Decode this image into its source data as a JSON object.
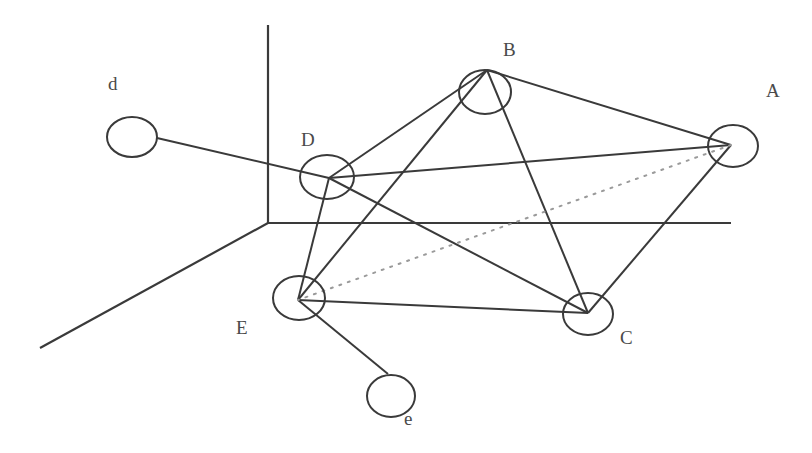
{
  "figure": {
    "type": "graph-diagram",
    "colors": {
      "background": "#ffffff",
      "stroke": "#3a3a3a",
      "dotted_edge": "#9a9a9a",
      "label": "#4a4a4a"
    }
  },
  "axes": [
    {
      "id": "vertical-axis",
      "x1": 268,
      "y1": 25,
      "x2": 268,
      "y2": 223
    },
    {
      "id": "horizontal-axis",
      "x1": 268,
      "y1": 223,
      "x2": 731,
      "y2": 223
    },
    {
      "id": "depth-axis",
      "x1": 268,
      "y1": 223,
      "x2": 40,
      "y2": 348
    }
  ],
  "nodes": [
    {
      "id": "A",
      "label": "A",
      "cx": 733,
      "cy": 146,
      "rx": 25,
      "ry": 21,
      "vx": 731,
      "vy": 145,
      "lx": 766,
      "ly": 97
    },
    {
      "id": "B",
      "label": "B",
      "cx": 485,
      "cy": 92,
      "rx": 26,
      "ry": 22,
      "vx": 487,
      "vy": 70,
      "lx": 503,
      "ly": 56
    },
    {
      "id": "C",
      "label": "C",
      "cx": 588,
      "cy": 314,
      "rx": 25,
      "ry": 21,
      "vx": 588,
      "vy": 313,
      "lx": 620,
      "ly": 344
    },
    {
      "id": "D",
      "label": "D",
      "cx": 327,
      "cy": 177,
      "rx": 27,
      "ry": 22,
      "vx": 329,
      "vy": 178,
      "lx": 301,
      "ly": 146
    },
    {
      "id": "E",
      "label": "E",
      "cx": 299,
      "cy": 298,
      "rx": 26,
      "ry": 22,
      "vx": 298,
      "vy": 300,
      "lx": 236,
      "ly": 334
    },
    {
      "id": "d",
      "label": "d",
      "cx": 132,
      "cy": 137,
      "rx": 25,
      "ry": 20,
      "vx": 157,
      "vy": 138,
      "lx": 108,
      "ly": 90
    },
    {
      "id": "e",
      "label": "e",
      "cx": 391,
      "cy": 396,
      "rx": 24,
      "ry": 21,
      "vx": 388,
      "vy": 374,
      "lx": 404,
      "ly": 425
    }
  ],
  "edges": [
    {
      "from": "d",
      "to": "D",
      "style": "solid"
    },
    {
      "from": "D",
      "to": "B",
      "style": "solid"
    },
    {
      "from": "D",
      "to": "A",
      "style": "solid"
    },
    {
      "from": "D",
      "to": "C",
      "style": "solid"
    },
    {
      "from": "D",
      "to": "E",
      "style": "solid"
    },
    {
      "from": "B",
      "to": "A",
      "style": "solid"
    },
    {
      "from": "B",
      "to": "C",
      "style": "solid"
    },
    {
      "from": "B",
      "to": "E",
      "style": "solid"
    },
    {
      "from": "A",
      "to": "C",
      "style": "solid"
    },
    {
      "from": "E",
      "to": "C",
      "style": "solid"
    },
    {
      "from": "E",
      "to": "e",
      "style": "solid"
    },
    {
      "from": "A",
      "to": "E",
      "style": "dotted"
    }
  ]
}
